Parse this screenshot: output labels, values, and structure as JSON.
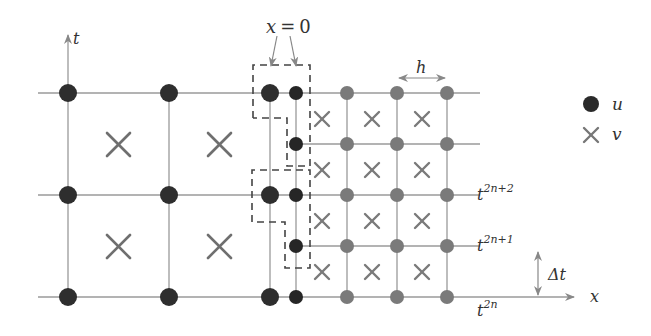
{
  "diagram": {
    "colors": {
      "u_coarse": "#2e2e2e",
      "u_fine_interface": "#262626",
      "u_fine": "#7a7a7a",
      "v_cross": "#777777",
      "grid_line": "#9a9a9a",
      "dashed_box": "#444444",
      "text": "#333333"
    },
    "axes": {
      "t_label": "t",
      "x_label": "x"
    },
    "interface": {
      "label_x": "x",
      "label_eq": "=",
      "label_zero": "0"
    },
    "spacing": {
      "h_label": "h",
      "dt_label_delta": "Δ",
      "dt_label_t": "t"
    },
    "time_levels": [
      {
        "base": "t",
        "sup": "2n+2"
      },
      {
        "base": "t",
        "sup": "2n+1"
      },
      {
        "base": "t",
        "sup": "2n"
      }
    ],
    "legend": [
      {
        "symbol": "filled-circle",
        "label": "u"
      },
      {
        "symbol": "cross",
        "label": "v"
      }
    ]
  }
}
